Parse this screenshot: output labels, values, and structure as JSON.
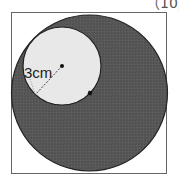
{
  "header": {
    "points_label": "（10点）"
  },
  "figure": {
    "frame": {
      "x": 11,
      "y": 12,
      "width": 156,
      "height": 162,
      "stroke": "#666666"
    },
    "outer_circle": {
      "cx": 89.5,
      "cy": 93,
      "r": 78,
      "fill": "#555555",
      "stroke": "#222222"
    },
    "inner_circle": {
      "cx": 62,
      "cy": 66,
      "r": 39,
      "fill": "#e8e8e8",
      "stroke": "#222222"
    },
    "inner_center_dot": {
      "cx": 62,
      "cy": 66
    },
    "outer_center_dot": {
      "cx": 90,
      "cy": 93
    },
    "radius_line": {
      "x1": 62,
      "y1": 66,
      "x2": 35,
      "y2": 95
    },
    "radius_label": "3cm",
    "colors": {
      "shaded": "#555555",
      "unshaded": "#e8e8e8",
      "line": "#222222",
      "background": "#ffffff"
    }
  }
}
